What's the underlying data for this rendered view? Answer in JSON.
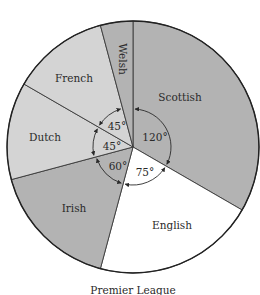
{
  "chart_data": {
    "type": "pie",
    "title": "Premier League",
    "categories": [
      "Scottish",
      "English",
      "Irish",
      "Dutch",
      "French",
      "Welsh"
    ],
    "values": [
      120,
      75,
      60,
      45,
      45,
      15
    ],
    "unit": "degrees",
    "labelled_angles": [
      "120°",
      "75°",
      "60°",
      "45°",
      "45°"
    ],
    "colors": {
      "Scottish": "#b3b3b3",
      "English": "#ffffff",
      "Irish": "#b3b3b3",
      "Dutch": "#d4d4d4",
      "French": "#d4d4d4",
      "Welsh": "#b3b3b3"
    }
  },
  "slices": [
    {
      "name": "Scottish",
      "label": "Scottish",
      "angle_label": "120°"
    },
    {
      "name": "English",
      "label": "English",
      "angle_label": "75°"
    },
    {
      "name": "Irish",
      "label": "Irish",
      "angle_label": "60°"
    },
    {
      "name": "Dutch",
      "label": "Dutch",
      "angle_label": "45°"
    },
    {
      "name": "French",
      "label": "French",
      "angle_label": "45°"
    },
    {
      "name": "Welsh",
      "label": "Welsh"
    }
  ],
  "caption": "Premier League"
}
